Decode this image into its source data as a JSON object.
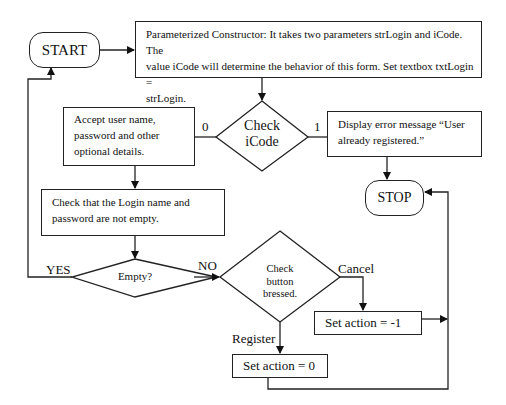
{
  "flowchart": {
    "start": {
      "label": "START"
    },
    "stop": {
      "label": "STOP"
    },
    "constructor_box": {
      "lines": [
        "Parameterized Constructor: It takes two parameters strLogin and iCode. The",
        "value iCode will determine the behavior of this form. Set textbox txtLogin =",
        "strLogin."
      ]
    },
    "check_icode": {
      "lines": [
        "Check",
        "iCode"
      ],
      "branch_0": "0",
      "branch_1": "1"
    },
    "accept_box": {
      "lines": [
        "Accept user name,",
        "password and other",
        "optional details."
      ]
    },
    "error_box": {
      "lines": [
        "Display error message “User",
        "already registered.”"
      ]
    },
    "check_login_box": {
      "lines": [
        "Check that the Login name and",
        "password are not empty."
      ]
    },
    "empty_decision": {
      "label": "Empty?",
      "yes": "YES",
      "no": "NO"
    },
    "button_decision": {
      "lines": [
        "Check",
        "button",
        "bressed."
      ],
      "cancel": "Cancel",
      "register": "Register"
    },
    "set_cancel": {
      "label": "Set action = -1"
    },
    "set_register": {
      "label": "Set action = 0"
    }
  }
}
